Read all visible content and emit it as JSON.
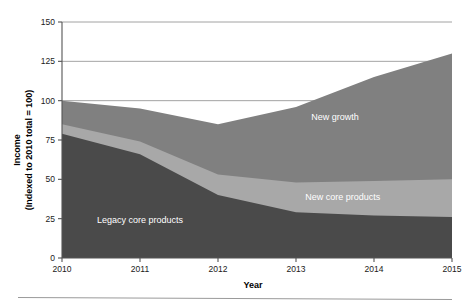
{
  "axes": {
    "y_title_line1": "Income",
    "y_title_line2": "(Indexed to 2010 total = 100)",
    "x_title": "Year",
    "y_ticks": [
      "0",
      "25",
      "50",
      "75",
      "100",
      "125",
      "150"
    ],
    "x_ticks": [
      "2010",
      "2011",
      "2012",
      "2013",
      "2014",
      "2015"
    ]
  },
  "series_labels": {
    "legacy": "Legacy core products",
    "new_core": "New core products",
    "new_growth": "New growth"
  },
  "colors": {
    "legacy": "#4a4a4a",
    "new_core": "#a8a8a8",
    "new_growth": "#808080",
    "axis": "#555555",
    "grid": "#8c8c8c",
    "label_text": "#ffffff",
    "background": "#ffffff"
  },
  "chart_data": {
    "type": "area",
    "title": "",
    "subtitle": "",
    "xlabel": "Year",
    "ylabel": "Income (Indexed to 2010 total = 100)",
    "stacked": true,
    "x": [
      2010,
      2011,
      2012,
      2013,
      2014,
      2015
    ],
    "categories": [
      "2010",
      "2011",
      "2012",
      "2013",
      "2014",
      "2015"
    ],
    "xlim": [
      2010,
      2015
    ],
    "ylim": [
      0,
      150
    ],
    "yticks": [
      0,
      25,
      50,
      75,
      100,
      125,
      150
    ],
    "grid": "horizontal",
    "legend": "inline-labels",
    "series": [
      {
        "name": "Legacy core products",
        "color": "#4a4a4a",
        "values": [
          79,
          66,
          40,
          29,
          27,
          26
        ],
        "cumulative_top": [
          79,
          66,
          40,
          29,
          27,
          26
        ]
      },
      {
        "name": "New core products",
        "color": "#a8a8a8",
        "values": [
          6,
          8,
          13,
          19,
          22,
          24
        ],
        "cumulative_top": [
          85,
          74,
          53,
          48,
          49,
          50
        ]
      },
      {
        "name": "New growth",
        "color": "#808080",
        "values": [
          15,
          21,
          32,
          48,
          66,
          80
        ],
        "cumulative_top": [
          100,
          95,
          85,
          96,
          115,
          130
        ]
      }
    ],
    "totals": [
      100,
      95,
      85,
      96,
      115,
      130
    ],
    "annotations": [
      {
        "text": "Legacy core products",
        "x": 2011.0,
        "y": 22
      },
      {
        "text": "New core products",
        "x": 2013.6,
        "y": 37
      },
      {
        "text": "New growth",
        "x": 2013.5,
        "y": 88
      }
    ]
  }
}
